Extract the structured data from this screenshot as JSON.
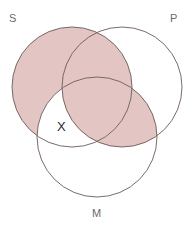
{
  "diagram": {
    "type": "venn-three-circle",
    "title": "",
    "background_color": "#ffffff",
    "circle_stroke_color": "#6b5a58",
    "circle_stroke_width": 0.9,
    "shade_color": "#e3c6c3",
    "label_color": "#6a6a6a",
    "mark_color": "#2a2a2a",
    "circles": [
      {
        "id": "S",
        "label": "S",
        "cx": 72,
        "cy": 87,
        "r": 60,
        "label_x": 9,
        "label_y": 13
      },
      {
        "id": "P",
        "label": "P",
        "cx": 122,
        "cy": 87,
        "r": 60,
        "label_x": 170,
        "label_y": 13
      },
      {
        "id": "M",
        "label": "M",
        "cx": 97,
        "cy": 137,
        "r": 60,
        "label_x": 92,
        "label_y": 208
      }
    ],
    "labels": {
      "s": "S",
      "p": "P",
      "m": "M"
    },
    "marks": [
      {
        "id": "x-sm",
        "symbol": "X",
        "region": "S and M only",
        "x": 57,
        "y": 120
      }
    ],
    "shaded_regions": [
      "S only",
      "S and P only",
      "S and P and M",
      "P and M only"
    ],
    "unshaded_regions": [
      "P only",
      "M only",
      "S and M only"
    ]
  }
}
